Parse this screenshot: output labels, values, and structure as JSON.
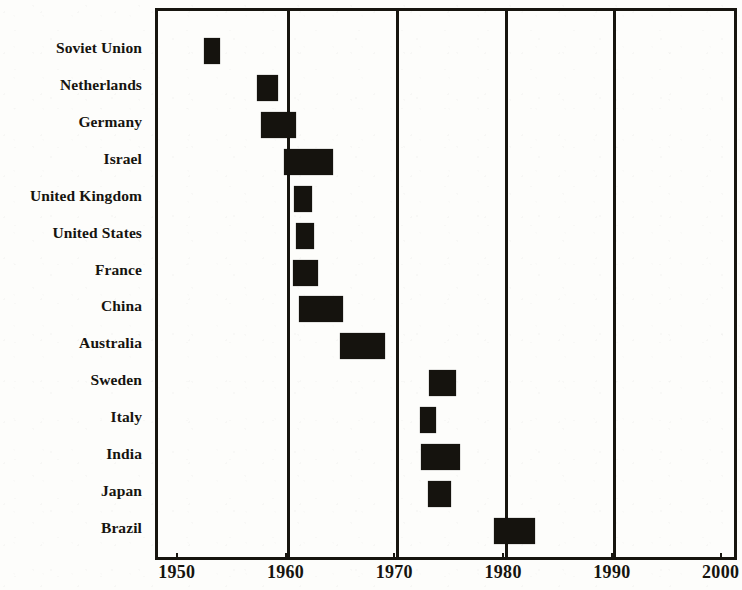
{
  "chart_data": {
    "type": "bar",
    "orientation": "horizontal",
    "title": "",
    "subtitle": "",
    "xlabel": "",
    "ylabel": "",
    "xlim": [
      1948,
      2001.5
    ],
    "grid": true,
    "gridlines": [
      1960,
      1970,
      1980,
      1990
    ],
    "legend": null,
    "x_ticks": [
      "1950",
      "1960",
      "1970",
      "1980",
      "1990",
      "2000"
    ],
    "x_tick_values": [
      1950,
      1960,
      1970,
      1980,
      1990,
      2000
    ],
    "categories": [
      "Soviet Union",
      "Netherlands",
      "Germany",
      "Israel",
      "United Kingdom",
      "United States",
      "France",
      "China",
      "Australia",
      "Sweden",
      "Italy",
      "India",
      "Japan",
      "Brazil"
    ],
    "bar_color": "#15130e",
    "ranges": [
      {
        "category": "Soviet Union",
        "start": 1952.2,
        "end": 1953.7
      },
      {
        "category": "Netherlands",
        "start": 1957.1,
        "end": 1959.0
      },
      {
        "category": "Germany",
        "start": 1957.5,
        "end": 1960.7
      },
      {
        "category": "Israel",
        "start": 1959.6,
        "end": 1964.1
      },
      {
        "category": "United Kingdom",
        "start": 1960.5,
        "end": 1962.2
      },
      {
        "category": "United States",
        "start": 1960.7,
        "end": 1962.3
      },
      {
        "category": "France",
        "start": 1960.4,
        "end": 1962.7
      },
      {
        "category": "China",
        "start": 1961.0,
        "end": 1965.0
      },
      {
        "category": "Australia",
        "start": 1964.7,
        "end": 1968.9
      },
      {
        "category": "Sweden",
        "start": 1972.9,
        "end": 1975.4
      },
      {
        "category": "Italy",
        "start": 1972.1,
        "end": 1973.6
      },
      {
        "category": "India",
        "start": 1972.2,
        "end": 1975.8
      },
      {
        "category": "Japan",
        "start": 1972.8,
        "end": 1974.9
      },
      {
        "category": "Brazil",
        "start": 1978.9,
        "end": 1982.7
      }
    ]
  }
}
